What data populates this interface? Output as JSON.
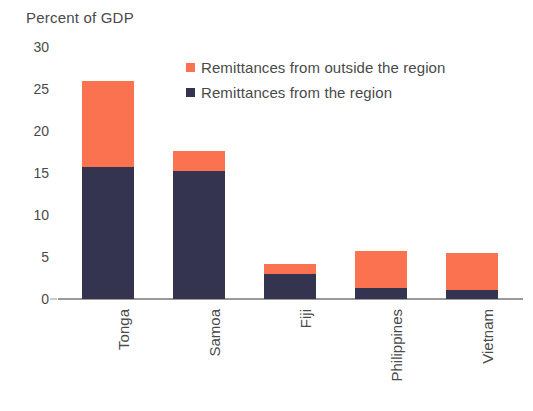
{
  "chart_data": {
    "type": "bar",
    "stacked": true,
    "title": "",
    "subtitle": "",
    "header_label": "Percent of GDP",
    "xlabel": "",
    "ylabel": "Percent of GDP",
    "ylim": [
      0,
      30
    ],
    "ytick_values": [
      30,
      25,
      20,
      15,
      10,
      5,
      0
    ],
    "ytick_labels": [
      "30",
      "25",
      "20",
      "15",
      "10",
      "5",
      "0"
    ],
    "grid": false,
    "legend_position": "top-right-inside",
    "categories": [
      "Tonga",
      "Samoa",
      "Fiji",
      "Philippines",
      "Vietnam"
    ],
    "series": [
      {
        "name": "Remittances from the region",
        "color": "#343450",
        "values": [
          15.7,
          15.2,
          3.0,
          1.3,
          1.1
        ]
      },
      {
        "name": "Remittances from outside the region",
        "color": "#FA7250",
        "values": [
          10.2,
          2.4,
          1.2,
          4.4,
          4.4
        ]
      }
    ],
    "totals": [
      25.9,
      17.6,
      4.2,
      5.7,
      5.5
    ]
  },
  "legend": {
    "items": [
      {
        "label": "Remittances from outside the region",
        "swatch_name": "legend-swatch-outside-region",
        "color": "#FA7250"
      },
      {
        "label": "Remittances from the region",
        "swatch_name": "legend-swatch-within-region",
        "color": "#343450"
      }
    ]
  },
  "colors": {
    "outside_region": "#FA7250",
    "within_region": "#343450",
    "axis": "#9a9a9a",
    "text": "#4a4a4a",
    "background": "#ffffff"
  }
}
